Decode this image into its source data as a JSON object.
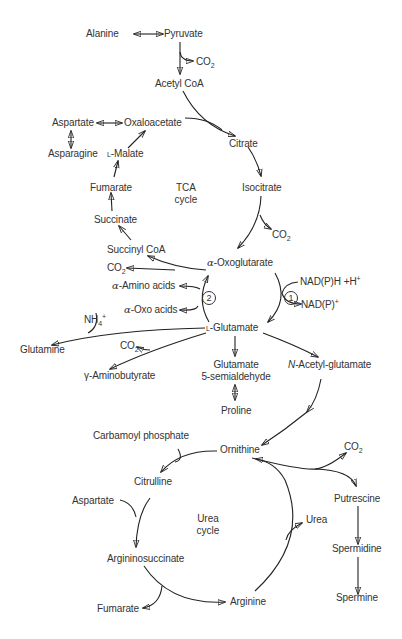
{
  "diagram": {
    "type": "metabolic-pathway",
    "cycles": {
      "tca": {
        "line1": "TCA",
        "line2": "cycle"
      },
      "urea": {
        "line1": "Urea",
        "line2": "cycle"
      }
    },
    "nodes": {
      "alanine": "Alanine",
      "pyruvate": "Pyruvate",
      "co2_pyruvate": "CO",
      "acetyl_coa": "Acetyl CoA",
      "aspartate_top": "Aspartate",
      "oxaloacetate": "Oxaloacetate",
      "asparagine": "Asparagine",
      "l_malate_prefix": "L",
      "l_malate": "-Malate",
      "citrate": "Citrate",
      "fumarate_tca": "Fumarate",
      "isocitrate": "Isocitrate",
      "succinate": "Succinate",
      "co2_isocitrate": "CO",
      "succinyl_coa": "Succinyl CoA",
      "oxoglutarate_prefix": "α",
      "oxoglutarate": "-Oxoglutarate",
      "co2_oxoglutarate": "CO",
      "nadph": "NAD(P)H +H",
      "nadph_sup": "+",
      "nadp": "NAD(P)",
      "nadp_sup": "+",
      "amino_acids_prefix": "α",
      "amino_acids": "-Amino acids",
      "oxo_acids_prefix": "α",
      "oxo_acids": "-Oxo acids",
      "enzyme_1": "1",
      "enzyme_2": "2",
      "nh4": "NH",
      "nh4_sub": "4",
      "nh4_sup": "+",
      "l_glutamate_prefix": "L",
      "l_glutamate": "-Glutamate",
      "glutamine": "Glutamine",
      "co2_gaba": "CO",
      "gaba": "γ-Aminobutyrate",
      "glutamate_semialdehyde_1": "Glutamate",
      "glutamate_semialdehyde_2": "5-semialdehyde",
      "n_acetyl_prefix": "N",
      "n_acetyl_glutamate": "-Acetyl-glutamate",
      "proline": "Proline",
      "carbamoyl_phosphate": "Carbamoyl phosphate",
      "ornithine": "Ornithine",
      "co2_ornithine": "CO",
      "citrulline": "Citrulline",
      "aspartate_urea": "Aspartate",
      "urea": "Urea",
      "putrescine": "Putrescine",
      "argininosuccinate": "Argininosuccinate",
      "spermidine": "Spermidine",
      "fumarate_urea": "Fumarate",
      "arginine": "Arginine",
      "spermine": "Spermine",
      "subscript_2": "2"
    },
    "edges": [
      {
        "from": "Alanine",
        "to": "Pyruvate",
        "bidirectional": true
      },
      {
        "from": "Pyruvate",
        "to": "Acetyl CoA",
        "byproduct": "CO2"
      },
      {
        "from": "Acetyl CoA",
        "to": "Citrate",
        "with": "Oxaloacetate"
      },
      {
        "from": "Aspartate",
        "to": "Oxaloacetate",
        "bidirectional": true
      },
      {
        "from": "Aspartate",
        "to": "Asparagine",
        "bidirectional": true
      },
      {
        "from": "Citrate",
        "to": "Isocitrate"
      },
      {
        "from": "Isocitrate",
        "to": "α-Oxoglutarate",
        "byproduct": "CO2"
      },
      {
        "from": "α-Oxoglutarate",
        "to": "Succinyl CoA",
        "byproduct": "CO2"
      },
      {
        "from": "Succinyl CoA",
        "to": "Succinate"
      },
      {
        "from": "Succinate",
        "to": "Fumarate"
      },
      {
        "from": "Fumarate",
        "to": "L-Malate"
      },
      {
        "from": "L-Malate",
        "to": "Oxaloacetate"
      },
      {
        "from": "α-Oxoglutarate",
        "to": "L-Glutamate",
        "enzyme": "1",
        "cofactor_in": "NAD(P)H +H+",
        "cofactor_out": "NAD(P)+"
      },
      {
        "from": "L-Glutamate",
        "to": "α-Oxoglutarate",
        "enzyme": "2",
        "cosubstrate_in": "α-Amino acids",
        "coproduct_out": "α-Oxo acids"
      },
      {
        "from": "L-Glutamate",
        "to": "Glutamine",
        "cosubstrate_in": "NH4+"
      },
      {
        "from": "L-Glutamate",
        "to": "γ-Aminobutyrate",
        "byproduct": "CO2"
      },
      {
        "from": "L-Glutamate",
        "to": "Glutamate 5-semialdehyde"
      },
      {
        "from": "Glutamate 5-semialdehyde",
        "to": "Proline",
        "bidirectional": true
      },
      {
        "from": "L-Glutamate",
        "to": "N-Acetyl-glutamate"
      },
      {
        "from": "N-Acetyl-glutamate",
        "to": "Ornithine"
      },
      {
        "from": "Ornithine",
        "to": "Citrulline",
        "cosubstrate_in": "Carbamoyl phosphate"
      },
      {
        "from": "Citrulline",
        "to": "Argininosuccinate",
        "cosubstrate_in": "Aspartate"
      },
      {
        "from": "Argininosuccinate",
        "to": "Arginine",
        "byproduct": "Fumarate"
      },
      {
        "from": "Arginine",
        "to": "Ornithine",
        "byproduct": "Urea"
      },
      {
        "from": "Ornithine",
        "to": "Putrescine",
        "byproduct": "CO2"
      },
      {
        "from": "Putrescine",
        "to": "Spermidine"
      },
      {
        "from": "Spermidine",
        "to": "Spermine"
      }
    ]
  }
}
